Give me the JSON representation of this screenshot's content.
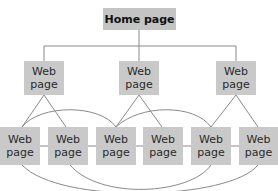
{
  "diagram": {
    "type": "website-structure",
    "colors": {
      "box_fill": "#c9c9c9",
      "line": "#8a8a8a",
      "text": "#2a2a2a"
    },
    "home": {
      "label": "Home page"
    },
    "level2": [
      {
        "label": "Web\npage"
      },
      {
        "label": "Web\npage"
      },
      {
        "label": "Web\npage"
      }
    ],
    "level3": [
      {
        "label": "Web\npage"
      },
      {
        "label": "Web\npage"
      },
      {
        "label": "Web\npage"
      },
      {
        "label": "Web\npage"
      },
      {
        "label": "Web\npage"
      },
      {
        "label": "Web\npage"
      }
    ]
  }
}
